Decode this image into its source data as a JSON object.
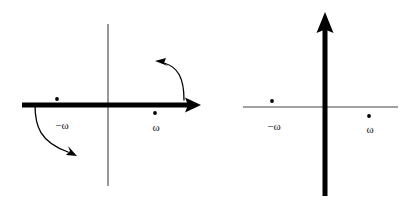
{
  "figure": {
    "background_color": "#ffffff",
    "ink_color": "#000000",
    "thin_line_color": "#444444",
    "width": 419,
    "height": 214,
    "panels": [
      {
        "id": "left-panel",
        "name": "real-axis-contour-panel",
        "description": "Bold horizontal real axis with rightward arrowhead, thin vertical imaginary axis, two poles and two curved deformation arrows",
        "origin": {
          "x": 108,
          "y": 105
        },
        "bold_axis": {
          "orientation": "horizontal",
          "name": "real-axis",
          "x1": 22,
          "y1": 105,
          "x2": 193,
          "y2": 105,
          "stroke_width": 5,
          "arrow": {
            "direction": "right",
            "tip_x": 201,
            "tip_y": 105,
            "size": 9
          }
        },
        "thin_axis": {
          "orientation": "vertical",
          "name": "imaginary-axis",
          "x1": 108,
          "y1": 24,
          "x2": 108,
          "y2": 186,
          "stroke_width": 1.1
        },
        "poles": [
          {
            "name": "pole-minus-omega",
            "label": "−ω",
            "x": 57,
            "y": 99,
            "side": "above-axis",
            "label_x": 62,
            "label_y": 126,
            "radius": 1.9
          },
          {
            "name": "pole-omega",
            "label": "ω",
            "x": 155,
            "y": 113,
            "side": "below-axis",
            "label_x": 156,
            "label_y": 128,
            "radius": 1.9
          }
        ],
        "curved_arrows": [
          {
            "name": "deformation-arrow-lower-left",
            "path": "M 35,105 C 35,126 40,142 68,152",
            "arrow_tip": {
              "x": 76,
              "y": 155,
              "angle_deg": 22
            },
            "direction": "down-right",
            "stroke_width": 1.3
          },
          {
            "name": "deformation-arrow-upper-right",
            "path": "M 184,100 C 184,78 178,67 164,63",
            "arrow_tip": {
              "x": 156,
              "y": 62,
              "angle_deg": 198
            },
            "direction": "up-left",
            "stroke_width": 1.3
          }
        ]
      },
      {
        "id": "right-panel",
        "name": "imaginary-axis-contour-panel",
        "description": "Bold vertical imaginary axis with upward arrowhead, thin horizontal real axis, two poles, no curved arrows",
        "origin": {
          "x": 325,
          "y": 107
        },
        "bold_axis": {
          "orientation": "vertical",
          "name": "imaginary-axis",
          "x1": 325,
          "y1": 196,
          "x2": 325,
          "y2": 27,
          "stroke_width": 5,
          "arrow": {
            "direction": "up",
            "tip_x": 325,
            "tip_y": 12,
            "size": 9
          }
        },
        "thin_axis": {
          "orientation": "horizontal",
          "name": "real-axis",
          "x1": 243,
          "y1": 107,
          "x2": 398,
          "y2": 107,
          "stroke_width": 1.1
        },
        "poles": [
          {
            "name": "pole-minus-omega",
            "label": "−ω",
            "x": 272,
            "y": 101,
            "side": "above-axis",
            "label_x": 274,
            "label_y": 127,
            "radius": 1.9
          },
          {
            "name": "pole-omega",
            "label": "ω",
            "x": 369,
            "y": 116,
            "side": "below-axis",
            "label_x": 370,
            "label_y": 130,
            "radius": 1.9
          }
        ],
        "curved_arrows": []
      }
    ]
  }
}
